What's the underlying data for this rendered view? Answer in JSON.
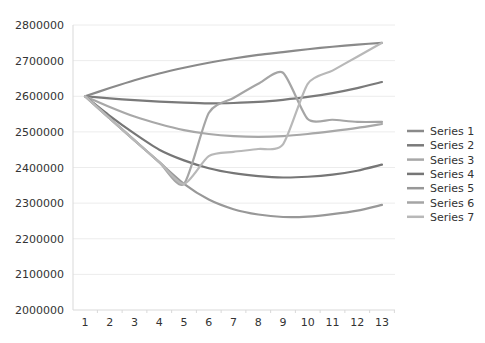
{
  "chart_data": {
    "type": "line",
    "title": "",
    "xlabel": "",
    "ylabel": "",
    "x": [
      1,
      2,
      3,
      4,
      5,
      6,
      7,
      8,
      9,
      10,
      11,
      12,
      13
    ],
    "ylim": [
      2000000,
      2800000
    ],
    "yticks": [
      "2000000",
      "2100000",
      "2200000",
      "2300000",
      "2400000",
      "2500000",
      "2600000",
      "2700000",
      "2800000"
    ],
    "xticks": [
      "1",
      "2",
      "3",
      "4",
      "5",
      "6",
      "7",
      "8",
      "9",
      "10",
      "11",
      "12",
      "13"
    ],
    "grid": true,
    "legend_position": "right",
    "series": [
      {
        "name": "Series 1",
        "color": "#8a8a8a",
        "values": [
          2600000,
          2623000,
          2645000,
          2664000,
          2680000,
          2694000,
          2706000,
          2716000,
          2724000,
          2732000,
          2739000,
          2745000,
          2750000
        ]
      },
      {
        "name": "Series 2",
        "color": "#7a7a7a",
        "values": [
          2600000,
          2594000,
          2589000,
          2585000,
          2582000,
          2580000,
          2581000,
          2584000,
          2590000,
          2598000,
          2609000,
          2623000,
          2640000
        ]
      },
      {
        "name": "Series 3",
        "color": "#a8a8a8",
        "values": [
          2600000,
          2570000,
          2543000,
          2522000,
          2505000,
          2494000,
          2488000,
          2486000,
          2488000,
          2494000,
          2502000,
          2511000,
          2522000
        ]
      },
      {
        "name": "Series 4",
        "color": "#767676",
        "values": [
          2600000,
          2545000,
          2495000,
          2450000,
          2420000,
          2398000,
          2384000,
          2376000,
          2372000,
          2374000,
          2380000,
          2391000,
          2408000
        ]
      },
      {
        "name": "Series 5",
        "color": "#989898",
        "values": [
          2600000,
          2538000,
          2476000,
          2415000,
          2354000,
          2310000,
          2283000,
          2268000,
          2261000,
          2262000,
          2269000,
          2279000,
          2295000
        ]
      },
      {
        "name": "Series 6",
        "color": "#a5a5a5",
        "values": [
          2600000,
          2538000,
          2476000,
          2415000,
          2354000,
          2553000,
          2595000,
          2635000,
          2666000,
          2536000,
          2534000,
          2528000,
          2528000
        ]
      },
      {
        "name": "Series 7",
        "color": "#b8b8b8",
        "values": [
          2600000,
          2538000,
          2476000,
          2415000,
          2354000,
          2432000,
          2444000,
          2452000,
          2465000,
          2635000,
          2672000,
          2711000,
          2750000
        ]
      }
    ]
  }
}
